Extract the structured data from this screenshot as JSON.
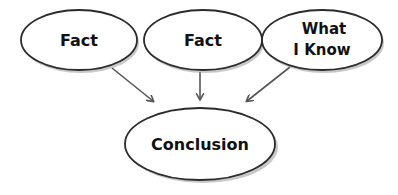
{
  "diagram": {
    "type": "flow",
    "nodes": [
      {
        "id": "fact1",
        "lines": [
          "Fact"
        ]
      },
      {
        "id": "fact2",
        "lines": [
          "Fact"
        ]
      },
      {
        "id": "know",
        "lines": [
          "What",
          "I Know"
        ]
      },
      {
        "id": "conclusion",
        "lines": [
          "Conclusion"
        ]
      }
    ],
    "edges": [
      {
        "from": "fact1",
        "to": "conclusion"
      },
      {
        "from": "fact2",
        "to": "conclusion"
      },
      {
        "from": "know",
        "to": "conclusion"
      }
    ],
    "colors": {
      "stroke": "#2b2b2b",
      "fill": "#ffffff",
      "shadow": "#9a9a9a",
      "arrow": "#555555",
      "text": "#111111"
    }
  }
}
